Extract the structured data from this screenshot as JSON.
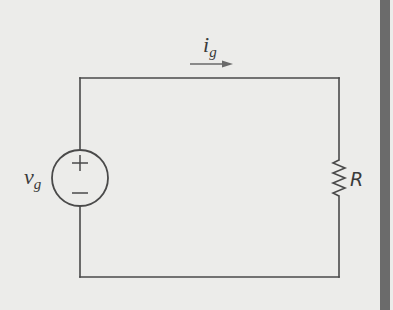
{
  "diagram": {
    "type": "circuit",
    "title": "",
    "components": [
      {
        "id": "source",
        "kind": "voltage-source",
        "label": "v",
        "subscript": "g",
        "polarity": {
          "top": "+",
          "bottom": "−"
        }
      },
      {
        "id": "resistor",
        "kind": "resistor",
        "label": "R"
      }
    ],
    "current": {
      "label": "i",
      "subscript": "g",
      "direction": "right"
    },
    "colors": {
      "background": "#ececea",
      "wire": "#4a4a4a",
      "text": "#3a3a3a",
      "edge_bar": "#6b6b6b"
    }
  }
}
